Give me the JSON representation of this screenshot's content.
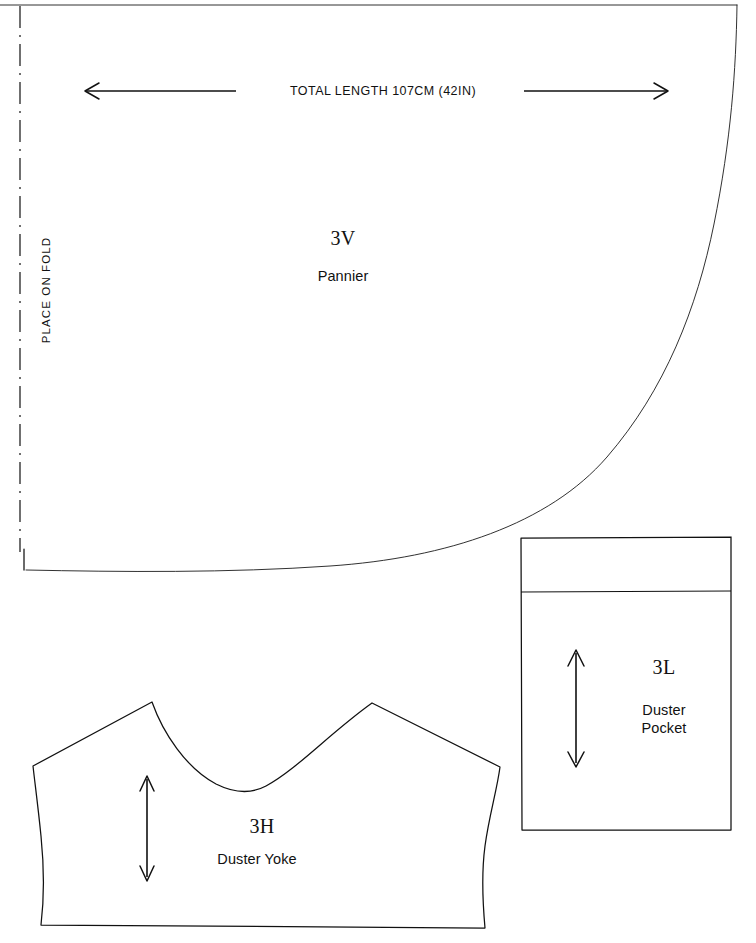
{
  "sheet": {
    "title": "Sewing Pattern Sheet",
    "background_color": "#ffffff",
    "line_color": "#111111",
    "width_px": 756,
    "height_px": 943
  },
  "fold": {
    "label": "PLACE ON FOLD"
  },
  "dimension": {
    "label": "TOTAL LENGTH 107CM (42IN)"
  },
  "pieces": [
    {
      "code": "3V",
      "name": "Pannier",
      "name_lines": "Pannier"
    },
    {
      "code": "3L",
      "name": "Duster Pocket",
      "name_line_1": "Duster",
      "name_line_2": "Pocket"
    },
    {
      "code": "3H",
      "name": "Duster Yoke",
      "name_lines": "Duster Yoke"
    }
  ]
}
